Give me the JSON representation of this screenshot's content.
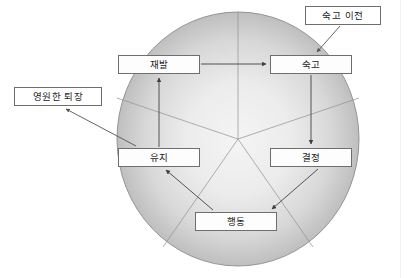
{
  "figure": {
    "type": "cycle-diagram",
    "title_visible": false,
    "background_color": "#ffffff",
    "ellipse": {
      "name": "shaded-ellipse",
      "cx": 238,
      "cy": 139,
      "rx": 121,
      "ry": 127,
      "fill_center_color": "#f2f2f2",
      "fill_edge_color": "#9a9a9a",
      "stroke_color": "#8a8a8a"
    },
    "hub": {
      "x": 238,
      "y": 139
    }
  },
  "nodes": [
    {
      "id": "relapse",
      "label": "재발",
      "x": 118,
      "y": 55,
      "w": 82,
      "h": 19
    },
    {
      "id": "contemplation",
      "label": "숙고",
      "x": 270,
      "y": 55,
      "w": 82,
      "h": 19
    },
    {
      "id": "maintenance",
      "label": "유지",
      "x": 118,
      "y": 148,
      "w": 82,
      "h": 19
    },
    {
      "id": "determination",
      "label": "결정",
      "x": 270,
      "y": 148,
      "w": 82,
      "h": 19
    },
    {
      "id": "action",
      "label": "행동",
      "x": 195,
      "y": 212,
      "w": 82,
      "h": 19
    }
  ],
  "annotations": [
    {
      "id": "precontemplation",
      "label": "숙고 이전",
      "x": 305,
      "y": 6,
      "w": 76,
      "h": 19,
      "points_to": "contemplation"
    },
    {
      "id": "permanent-exit",
      "label": "영원한 퇴장",
      "x": 14,
      "y": 87,
      "w": 88,
      "h": 19,
      "points_to": "maintenance"
    }
  ],
  "edges": [
    {
      "id": "relapse-to-contemplation",
      "from": "재발",
      "to": "숙고",
      "direction": "right"
    },
    {
      "id": "contemplation-to-determination",
      "from": "숙고",
      "to": "결정",
      "direction": "down"
    },
    {
      "id": "determination-to-action",
      "from": "결정",
      "to": "행동",
      "direction": "down-left"
    },
    {
      "id": "action-to-maintenance",
      "from": "행동",
      "to": "유지",
      "direction": "up-left"
    },
    {
      "id": "maintenance-to-relapse",
      "from": "유지",
      "to": "재발",
      "direction": "up"
    },
    {
      "id": "precontemplation-to-contemplation",
      "from": "숙고 이전",
      "to": "숙고",
      "direction": "down-left"
    },
    {
      "id": "maintenance-to-permanent-exit",
      "from": "유지",
      "to": "영원한 퇴장",
      "direction": "up-left"
    }
  ],
  "spokes": {
    "name": "radial-spoke-lines",
    "color": "#8d8d8d",
    "count": 5
  },
  "colors": {
    "box_border": "#6e6e6e",
    "box_fill": "#fdfdfd",
    "arrow": "#4a4a4a",
    "text": "#1a1a1a"
  }
}
